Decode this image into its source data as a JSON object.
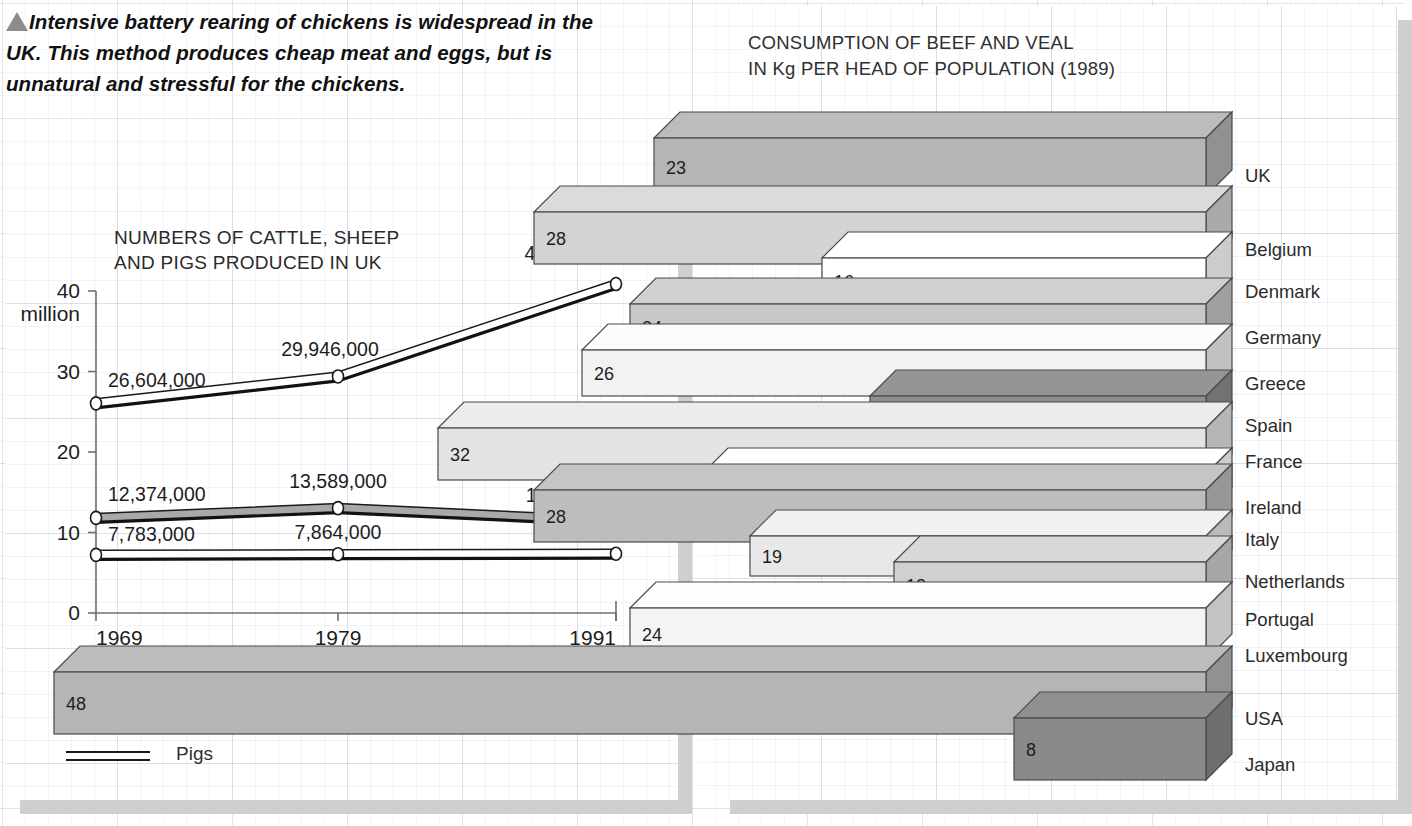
{
  "caption": {
    "marker_icon": "triangle-up-icon",
    "text": "Intensive battery rearing of chickens is widespread in the UK. This method produces cheap meat and eggs, but is unnatural and stressful for the chickens."
  },
  "left_panel": {
    "title": "NUMBERS OF CATTLE, SHEEP AND PIGS PRODUCED IN UK",
    "y_axis_unit": "million",
    "legend": [
      {
        "label": "Sheep and lambs",
        "color": "#ffffff"
      },
      {
        "label": "Cattle and calves",
        "color": "#a8a8a8"
      },
      {
        "label": "Pigs",
        "color": "#ffffff"
      }
    ]
  },
  "right_panel": {
    "title_line1": "CONSUMPTION OF BEEF AND VEAL",
    "title_line2": "IN Kg PER HEAD OF POPULATION (1989)"
  },
  "chart_data": [
    {
      "type": "line",
      "title": "NUMBERS OF CATTLE, SHEEP AND PIGS PRODUCED IN UK",
      "xlabel": "",
      "ylabel": "million",
      "x": [
        "1969",
        "1979",
        "1991"
      ],
      "yticks": [
        0,
        10,
        20,
        30,
        40
      ],
      "ylim": [
        0,
        40
      ],
      "grid": true,
      "legend_position": "below",
      "series": [
        {
          "name": "Sheep and lambs",
          "values": [
            26.604,
            29.946,
            41.427
          ],
          "labels": [
            "26,604,000",
            "29,946,000",
            "41,427,000"
          ],
          "color": "#ffffff"
        },
        {
          "name": "Cattle and calves",
          "values": [
            12.374,
            13.589,
            12.011
          ],
          "labels": [
            "12,374,000",
            "13,589,000",
            "12,011,000"
          ],
          "color": "#a8a8a8"
        },
        {
          "name": "Pigs",
          "values": [
            7.783,
            7.864,
            7.923
          ],
          "labels": [
            "7,783,000",
            "7,864,000",
            "7,923,000"
          ],
          "color": "#ffffff"
        }
      ]
    },
    {
      "type": "bar",
      "orientation": "horizontal-3d",
      "title": "CONSUMPTION OF BEEF AND VEAL IN Kg PER HEAD OF POPULATION (1989)",
      "unit": "Kg per head of population",
      "year": "1989",
      "categories": [
        "UK",
        "Belgium",
        "Denmark",
        "Germany",
        "Greece",
        "Spain",
        "France",
        "Ireland",
        "Italy",
        "Netherlands",
        "Portugal",
        "Luxembourg",
        "USA",
        "Japan"
      ],
      "values": [
        23,
        28,
        16,
        24,
        26,
        14,
        32,
        21,
        28,
        19,
        13,
        24,
        48,
        8
      ],
      "value_labels": [
        "23",
        "28",
        "16",
        "24",
        "26",
        "14",
        "32",
        "21",
        "28",
        "19",
        "13",
        "24",
        "48",
        "8"
      ],
      "bar_fills": [
        "#b5b5b5",
        "#d3d3d3",
        "#ffffff",
        "#c8c8c8",
        "#f2f2f2",
        "#8f8f8f",
        "#e3e3e3",
        "#ffffff",
        "#bdbdbd",
        "#e8e8e8",
        "#d0d0d0",
        "#f4f4f4",
        "#b5b5b5",
        "#8a8a8a"
      ],
      "xlim": [
        0,
        48
      ],
      "grid": true
    }
  ]
}
